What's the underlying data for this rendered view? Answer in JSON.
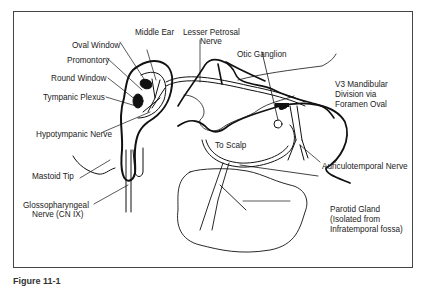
{
  "diagram": {
    "labels": {
      "middle_ear": "Middle Ear",
      "lesser_petrosal_1": "Lesser Petrosal",
      "lesser_petrosal_2": "Nerve",
      "oval_window": "Oval Window",
      "promontory": "Promontory",
      "round_window": "Round Window",
      "tympanic_plexus": "Tympanic Plexus",
      "otic_ganglion": "Otic Ganglion",
      "v3_1": "V3 Mandibular",
      "v3_2": "Division via",
      "v3_3": "Foramen Oval",
      "hypotympanic": "Hypotympanic Nerve",
      "to_scalp": "To Scalp",
      "auriculotemporal": "Auriculotemporal Nerve",
      "mastoid": "Mastoid Tip",
      "glosso_1": "Glossopharyngeal",
      "glosso_2": "Nerve (CN IX)",
      "parotid_1": "Parotid Gland",
      "parotid_2": "(Isolated from",
      "parotid_3": "Infratemporal fossa)"
    },
    "caption": "Figure 11-1"
  }
}
